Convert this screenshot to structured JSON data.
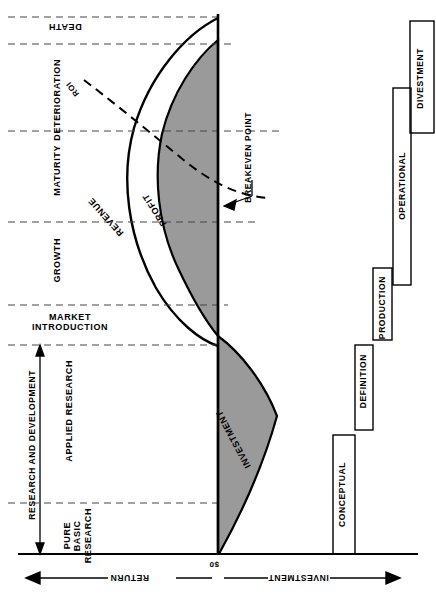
{
  "diagram": {
    "axis": {
      "zero_label": "$0",
      "left_axis_label": "RETURN",
      "right_axis_label": "INVESTMENT"
    },
    "life_cycle_stages": [
      {
        "label": "DEATH",
        "y_top": 17,
        "y_bottom": 44
      },
      {
        "label": "DETERIORATION",
        "y_top": 44,
        "y_bottom": 131
      },
      {
        "label": "MATURITY",
        "y_top": 131,
        "y_bottom": 222
      },
      {
        "label": "GROWTH",
        "y_top": 222,
        "y_bottom": 305
      },
      {
        "label": "MARKET\nINTRODUCTION",
        "y_top": 305,
        "y_bottom": 345
      },
      {
        "label": "APPLIED RESEARCH",
        "y_top": 345,
        "y_bottom": 503
      },
      {
        "label": "PURE\nBASIC\nRESEARCH",
        "y_top": 503,
        "y_bottom": 554
      }
    ],
    "bracket": {
      "label": "RESEARCH AND DEVELOPMENT"
    },
    "curve_labels": [
      {
        "name": "REVENUE"
      },
      {
        "name": "PROFIT"
      },
      {
        "name": "INVESTMENT"
      },
      {
        "name": "ROI"
      }
    ],
    "annotations": [
      {
        "name": "BREAKEVEN POINT"
      }
    ],
    "program_phases": [
      {
        "label": "DIVESTMENT",
        "y_top": 21,
        "y_bottom": 133
      },
      {
        "label": "OPERATIONAL",
        "y_top": 88,
        "y_bottom": 285
      },
      {
        "label": "PRODUCTION",
        "y_top": 268,
        "y_bottom": 340
      },
      {
        "label": "DEFINITION",
        "y_top": 345,
        "y_bottom": 430
      },
      {
        "label": "CONCEPTUAL",
        "y_top": 435,
        "y_bottom": 554
      }
    ],
    "colors": {
      "ink": "#000000",
      "shade": "#9a9a9a",
      "paper": "#ffffff",
      "divider": "#444444"
    }
  }
}
